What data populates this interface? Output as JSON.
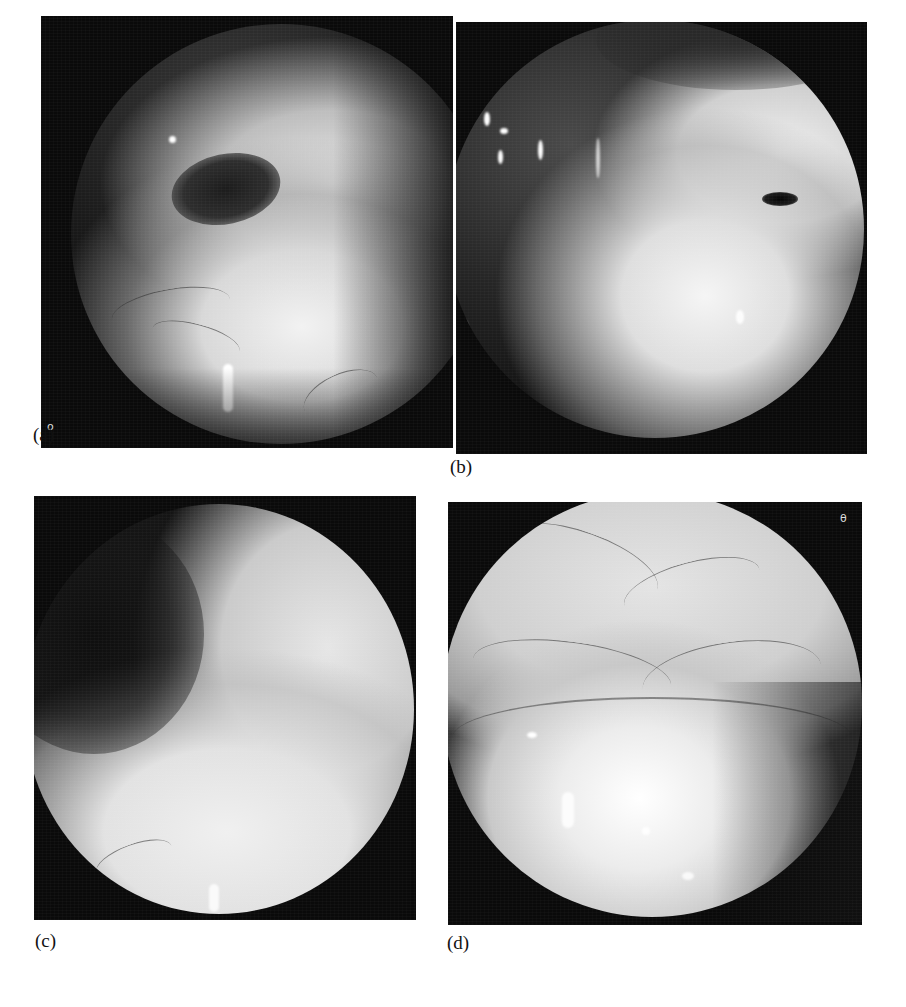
{
  "figure": {
    "panels": [
      {
        "id": "a",
        "label": "(a)",
        "corner_mark": "o",
        "description": "Endoscopic view: dark cavity with a small dark orifice upper-left, bright mucosal fold center with fine vessels, bright reflection near lower center"
      },
      {
        "id": "b",
        "label": "(b)",
        "description": "Endoscopic view: bright mucosa right and lower, dark region left with specular bubble reflections, small dark slit-like orifice on right"
      },
      {
        "id": "c",
        "label": "(c)",
        "description": "Endoscopic view: dark upper-left area, uniformly bright smooth mucosa occupying lower and right portions"
      },
      {
        "id": "d",
        "label": "(d)",
        "corner_mark": "θ",
        "description": "Endoscopic view: upper wall with dense branching vessel network, bright rounded bulge in lower center with specular highlights"
      }
    ]
  },
  "colors": {
    "page_background": "#ffffff",
    "panel_background": "#0a0a0a",
    "label_text": "#111111"
  }
}
